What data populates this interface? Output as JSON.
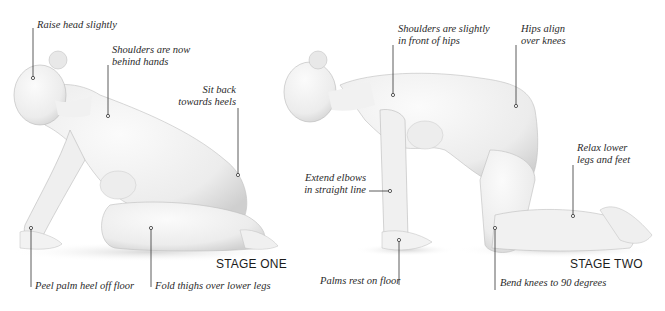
{
  "stages": [
    {
      "title": "STAGE ONE",
      "labels": [
        "Raise head slightly",
        "Shoulders are now",
        "behind hands",
        "Sit back",
        "towards heels",
        "Peel palm heel off floor",
        "Fold thighs over lower legs"
      ]
    },
    {
      "title": "STAGE TWO",
      "labels": [
        "Shoulders are slightly",
        "in front of hips",
        "Hips align",
        "over knees",
        "Relax lower",
        "legs and feet",
        "Extend elbows",
        "in straight line",
        "Palms rest on floor",
        "Bend knees to 90 degrees"
      ]
    }
  ],
  "colors": {
    "skin_light": "#f6f6f6",
    "skin_mid": "#e2e2e2",
    "skin_shadow": "#c9c9c9",
    "leader_line": "#333333",
    "text": "#2a2a2a"
  }
}
